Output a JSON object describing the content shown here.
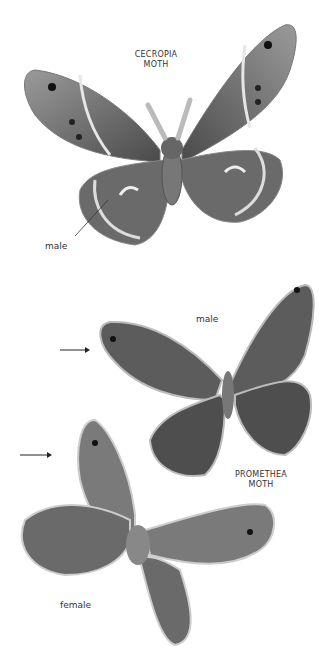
{
  "figures": {
    "cecropia": {
      "title_line1": "CECROPIA",
      "title_line2": "MOTH",
      "sex_label": "male"
    },
    "promethea": {
      "title_line1": "PROMETHEA",
      "title_line2": "MOTH",
      "male_label": "male",
      "female_label": "female"
    }
  },
  "colors": {
    "wing_dark": "#555555",
    "wing_mid": "#888888",
    "wing_light": "#d8d8d8",
    "text": "#333333"
  }
}
